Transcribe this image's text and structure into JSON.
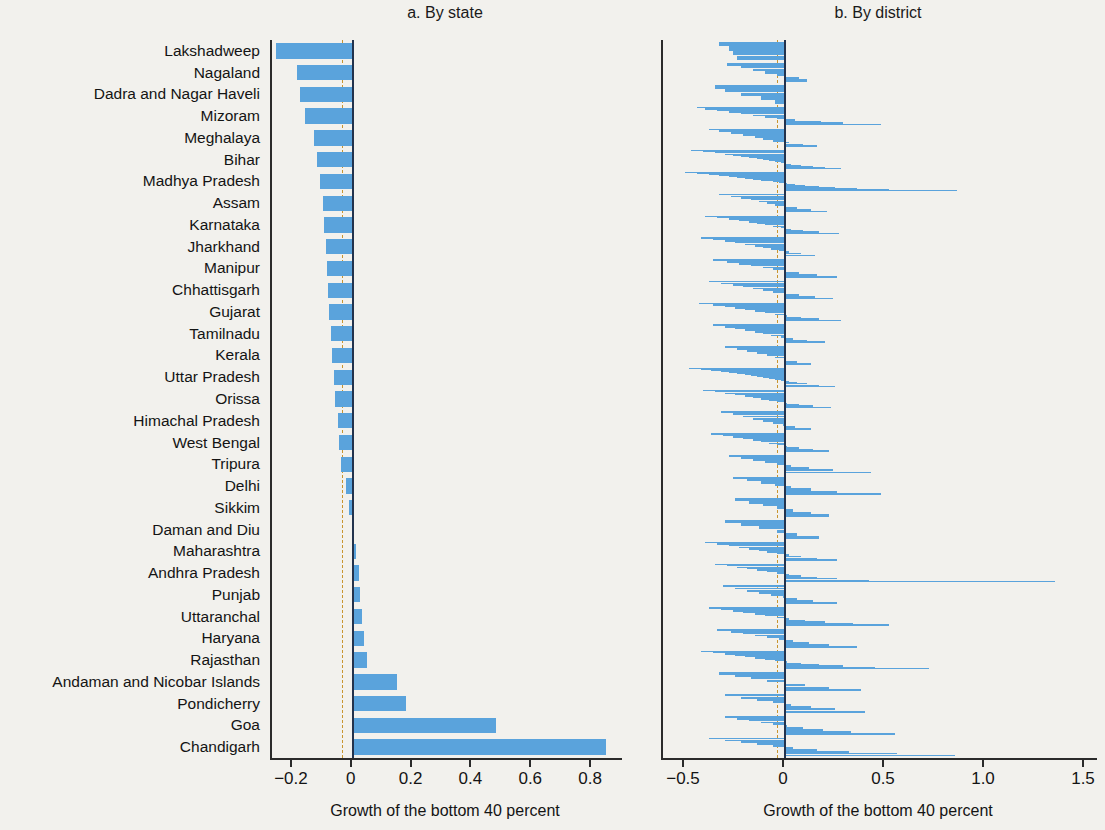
{
  "figure": {
    "background_color": "#f2f1ed",
    "bar_color": "#5aa3dc",
    "zero_line_color": "#23334d",
    "reference_line_color": "#c8952f"
  },
  "panel_a": {
    "title": "a. By state",
    "axis_title": "Growth of the bottom 40 percent"
  },
  "panel_b": {
    "title": "b. By district",
    "axis_title": "Growth of the bottom 40 percent"
  },
  "chart_data": [
    {
      "type": "bar",
      "id": "panel-a",
      "title": "a. By state",
      "orientation": "horizontal",
      "xlabel": "Growth of the bottom 40 percent",
      "ylabel": "",
      "xlim": [
        -0.27,
        0.9
      ],
      "xticks": [
        -0.2,
        0,
        0.2,
        0.4,
        0.6,
        0.8
      ],
      "xticklabels": [
        "−0.2",
        "0",
        "0.2",
        "0.4",
        "0.6",
        "0.8"
      ],
      "grid": false,
      "legend": null,
      "reference_line": -0.037,
      "zero_line": 0,
      "categories": [
        "Lakshadweep",
        "Nagaland",
        "Dadra and Nagar Haveli",
        "Mizoram",
        "Meghalaya",
        "Bihar",
        "Madhya Pradesh",
        "Assam",
        "Karnataka",
        "Jharkhand",
        "Manipur",
        "Chhattisgarh",
        "Gujarat",
        "Tamilnadu",
        "Kerala",
        "Uttar Pradesh",
        "Orissa",
        "Himachal Pradesh",
        "West Bengal",
        "Tripura",
        "Delhi",
        "Sikkim",
        "Daman and Diu",
        "Maharashtra",
        "Andhra Pradesh",
        "Punjab",
        "Uttaranchal",
        "Haryana",
        "Rajasthan",
        "Andaman and Nicobar Islands",
        "Pondicherry",
        "Goa",
        "Chandigarh"
      ],
      "values": [
        -0.255,
        -0.185,
        -0.175,
        -0.16,
        -0.128,
        -0.12,
        -0.11,
        -0.1,
        -0.095,
        -0.09,
        -0.085,
        -0.082,
        -0.078,
        -0.072,
        -0.068,
        -0.062,
        -0.058,
        -0.05,
        -0.045,
        -0.04,
        -0.022,
        -0.012,
        0.004,
        0.012,
        0.02,
        0.024,
        0.032,
        0.038,
        0.048,
        0.148,
        0.178,
        0.48,
        0.845
      ]
    },
    {
      "type": "bar",
      "id": "panel-b",
      "title": "b. By district",
      "orientation": "horizontal",
      "description": "Thin horizontal bars: each district within each state, states ordered identically to panel a.",
      "xlabel": "Growth of the bottom 40 percent",
      "ylabel": "",
      "xlim": [
        -0.61,
        1.56
      ],
      "xticks": [
        -0.5,
        0,
        0.5,
        1.0,
        1.5
      ],
      "xticklabels": [
        "−0.5",
        "0",
        "0.5",
        "1.0",
        "1.5"
      ],
      "grid": false,
      "legend": null,
      "reference_line": -0.04,
      "zero_line": 0,
      "groups": [
        {
          "state": "Lakshadweep",
          "values": [
            -0.33,
            -0.28,
            -0.26,
            -0.24
          ]
        },
        {
          "state": "Nagaland",
          "values": [
            -0.29,
            -0.22,
            -0.16,
            -0.1,
            -0.04,
            0.07,
            0.11
          ]
        },
        {
          "state": "Dadra and Nagar Haveli",
          "values": [
            -0.35,
            -0.3,
            -0.22,
            -0.12,
            -0.05
          ]
        },
        {
          "state": "Mizoram",
          "values": [
            -0.44,
            -0.4,
            -0.34,
            -0.28,
            -0.22,
            -0.16,
            -0.1,
            -0.04,
            0.05,
            0.18,
            0.29,
            0.48
          ]
        },
        {
          "state": "Meghalaya",
          "values": [
            -0.38,
            -0.33,
            -0.27,
            -0.21,
            -0.15,
            -0.11,
            -0.06,
            0.02,
            0.09,
            0.16
          ]
        },
        {
          "state": "Bihar",
          "values": [
            -0.47,
            -0.41,
            -0.35,
            -0.3,
            -0.26,
            -0.22,
            -0.18,
            -0.14,
            -0.11,
            -0.08,
            -0.05,
            -0.02,
            0.03,
            0.08,
            0.14,
            0.2,
            0.28
          ]
        },
        {
          "state": "Madhya Pradesh",
          "values": [
            -0.5,
            -0.44,
            -0.38,
            -0.33,
            -0.28,
            -0.24,
            -0.2,
            -0.16,
            -0.12,
            -0.09,
            -0.06,
            -0.03,
            0.01,
            0.05,
            0.1,
            0.17,
            0.25,
            0.36,
            0.52,
            0.86
          ]
        },
        {
          "state": "Assam",
          "values": [
            -0.33,
            -0.27,
            -0.22,
            -0.17,
            -0.13,
            -0.09,
            -0.05,
            0.0,
            0.06,
            0.13,
            0.21
          ]
        },
        {
          "state": "Karnataka",
          "values": [
            -0.4,
            -0.34,
            -0.28,
            -0.23,
            -0.18,
            -0.14,
            -0.1,
            -0.06,
            -0.02,
            0.03,
            0.09,
            0.17,
            0.27
          ]
        },
        {
          "state": "Jharkhand",
          "values": [
            -0.42,
            -0.36,
            -0.3,
            -0.25,
            -0.2,
            -0.15,
            -0.11,
            -0.07,
            -0.03,
            0.02,
            0.08,
            0.15
          ]
        },
        {
          "state": "Manipur",
          "values": [
            -0.36,
            -0.29,
            -0.23,
            -0.17,
            -0.11,
            -0.06,
            0.0,
            0.07,
            0.16,
            0.26
          ]
        },
        {
          "state": "Chhattisgarh",
          "values": [
            -0.38,
            -0.32,
            -0.26,
            -0.21,
            -0.16,
            -0.11,
            -0.06,
            0.0,
            0.07,
            0.15,
            0.24
          ]
        },
        {
          "state": "Gujarat",
          "values": [
            -0.43,
            -0.36,
            -0.3,
            -0.25,
            -0.2,
            -0.15,
            -0.1,
            -0.05,
            0.01,
            0.08,
            0.17,
            0.28
          ]
        },
        {
          "state": "Tamilnadu",
          "values": [
            -0.36,
            -0.3,
            -0.25,
            -0.2,
            -0.15,
            -0.11,
            -0.07,
            -0.02,
            0.04,
            0.11,
            0.2
          ]
        },
        {
          "state": "Kerala",
          "values": [
            -0.3,
            -0.24,
            -0.19,
            -0.14,
            -0.09,
            -0.05,
            0.0,
            0.06,
            0.13
          ]
        },
        {
          "state": "Uttar Pradesh",
          "values": [
            -0.48,
            -0.42,
            -0.37,
            -0.32,
            -0.28,
            -0.24,
            -0.2,
            -0.17,
            -0.14,
            -0.11,
            -0.08,
            -0.05,
            -0.02,
            0.02,
            0.06,
            0.11,
            0.17,
            0.25
          ]
        },
        {
          "state": "Orissa",
          "values": [
            -0.41,
            -0.35,
            -0.3,
            -0.25,
            -0.2,
            -0.16,
            -0.12,
            -0.08,
            -0.04,
            0.01,
            0.07,
            0.14,
            0.23
          ]
        },
        {
          "state": "Himachal Pradesh",
          "values": [
            -0.32,
            -0.26,
            -0.21,
            -0.16,
            -0.11,
            -0.06,
            -0.01,
            0.05,
            0.13
          ]
        },
        {
          "state": "West Bengal",
          "values": [
            -0.37,
            -0.31,
            -0.26,
            -0.21,
            -0.16,
            -0.12,
            -0.08,
            -0.04,
            0.01,
            0.07,
            0.14,
            0.22
          ]
        },
        {
          "state": "Tripura",
          "values": [
            -0.28,
            -0.22,
            -0.16,
            -0.1,
            -0.04,
            0.03,
            0.12,
            0.24,
            0.43
          ]
        },
        {
          "state": "Delhi",
          "values": [
            -0.26,
            -0.19,
            -0.12,
            -0.05,
            0.03,
            0.13,
            0.26,
            0.48
          ]
        },
        {
          "state": "Sikkim",
          "values": [
            -0.25,
            -0.18,
            -0.11,
            -0.04,
            0.04,
            0.13,
            0.22
          ]
        },
        {
          "state": "Daman and Diu",
          "values": [
            -0.3,
            -0.22,
            -0.13,
            -0.04,
            0.06,
            0.17
          ]
        },
        {
          "state": "Maharashtra",
          "values": [
            -0.4,
            -0.34,
            -0.28,
            -0.23,
            -0.18,
            -0.13,
            -0.09,
            -0.04,
            0.02,
            0.08,
            0.16,
            0.26
          ]
        },
        {
          "state": "Andhra Pradesh",
          "values": [
            -0.35,
            -0.29,
            -0.24,
            -0.19,
            -0.14,
            -0.09,
            -0.04,
            0.02,
            0.08,
            0.16,
            0.26,
            0.42,
            1.35
          ]
        },
        {
          "state": "Punjab",
          "values": [
            -0.31,
            -0.25,
            -0.19,
            -0.13,
            -0.07,
            -0.01,
            0.06,
            0.14,
            0.26
          ]
        },
        {
          "state": "Uttaranchal",
          "values": [
            -0.38,
            -0.32,
            -0.26,
            -0.21,
            -0.15,
            -0.1,
            -0.04,
            0.02,
            0.1,
            0.2,
            0.34,
            0.52
          ]
        },
        {
          "state": "Haryana",
          "values": [
            -0.34,
            -0.27,
            -0.21,
            -0.15,
            -0.09,
            -0.03,
            0.04,
            0.12,
            0.22,
            0.36
          ]
        },
        {
          "state": "Rajasthan",
          "values": [
            -0.42,
            -0.36,
            -0.3,
            -0.25,
            -0.2,
            -0.15,
            -0.1,
            -0.05,
            0.01,
            0.08,
            0.17,
            0.29,
            0.45,
            0.72
          ]
        },
        {
          "state": "Andaman and Nicobar Islands",
          "values": [
            -0.33,
            -0.25,
            -0.17,
            -0.09,
            0.0,
            0.1,
            0.22,
            0.38
          ]
        },
        {
          "state": "Pondicherry",
          "values": [
            -0.3,
            -0.22,
            -0.14,
            -0.06,
            0.03,
            0.13,
            0.25,
            0.4
          ]
        },
        {
          "state": "Goa",
          "values": [
            -0.3,
            -0.24,
            -0.18,
            -0.12,
            -0.06,
            0.01,
            0.09,
            0.19,
            0.33,
            0.55
          ]
        },
        {
          "state": "Chandigarh",
          "values": [
            -0.38,
            -0.3,
            -0.22,
            -0.14,
            -0.06,
            0.04,
            0.16,
            0.32,
            0.56,
            0.85
          ]
        }
      ]
    }
  ]
}
